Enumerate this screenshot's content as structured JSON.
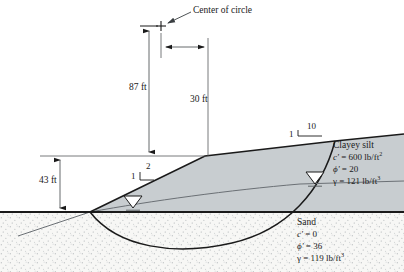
{
  "figure": {
    "name": "slope-stability-cross-section",
    "annotations": {
      "center_of_circle": "Center of circle",
      "dim_vertical_87": "87 ft",
      "dim_vertical_30": "30 ft",
      "dim_height_43": "43 ft",
      "slope_lower_rise": "1",
      "slope_lower_run": "2",
      "slope_upper_rise": "1",
      "slope_upper_run": "10"
    },
    "soils": [
      {
        "id": "clayey-silt",
        "name": "Clayey silt",
        "cohesion_symbol": "c'",
        "cohesion_value": "= 600 lb/ft",
        "cohesion_exp": "2",
        "phi_symbol": "ϕ'",
        "phi_value": "= 20",
        "gamma_symbol": "γ",
        "gamma_value": "= 121 lb/ft",
        "gamma_exp": "3"
      },
      {
        "id": "sand",
        "name": "Sand",
        "cohesion_symbol": "c'",
        "cohesion_value": "= 0",
        "cohesion_exp": "",
        "phi_symbol": "ϕ'",
        "phi_value": "= 36",
        "gamma_symbol": "γ",
        "gamma_value": "= 119 lb/ft",
        "gamma_exp": "3"
      }
    ],
    "colors": {
      "embankment_fill": "#c8cdd0",
      "sand_fill": "#f4f4f2",
      "line": "#1a1a1a",
      "thin_line": "#55595c",
      "text": "#1a1a1a"
    },
    "symbols": {
      "water_table_left": "water-table-triangle",
      "water_table_right": "water-table-triangle",
      "circle_center_marker": "plus-marker"
    }
  }
}
